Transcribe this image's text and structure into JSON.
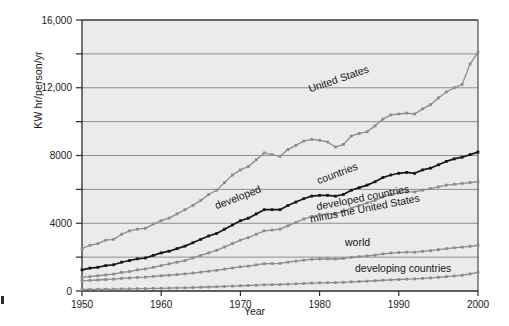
{
  "chart_data": {
    "type": "line",
    "title": "",
    "xlabel": "Year",
    "ylabel": "KW hr/person/yr",
    "xlim": [
      1950,
      2000
    ],
    "ylim": [
      0,
      16000
    ],
    "xticks": [
      1950,
      1960,
      1970,
      1980,
      1990,
      2000
    ],
    "xticklabels": [
      "1950",
      "1960",
      "1970",
      "1980",
      "1990",
      "2000"
    ],
    "yticks": [
      0,
      2000,
      4000,
      6000,
      8000,
      10000,
      12000,
      14000,
      16000
    ],
    "yticklabels": [
      "0",
      "",
      "4000",
      "",
      "8000",
      "",
      "12,000",
      "",
      "16,000"
    ],
    "grid": true,
    "grid_axis": "y",
    "legend": "inline-annotations",
    "plot_background": "#ebebeb",
    "x": [
      1950,
      1951,
      1952,
      1953,
      1954,
      1955,
      1956,
      1957,
      1958,
      1959,
      1960,
      1961,
      1962,
      1963,
      1964,
      1965,
      1966,
      1967,
      1968,
      1969,
      1970,
      1971,
      1972,
      1973,
      1974,
      1975,
      1976,
      1977,
      1978,
      1979,
      1980,
      1981,
      1982,
      1983,
      1984,
      1985,
      1986,
      1987,
      1988,
      1989,
      1990,
      1991,
      1992,
      1993,
      1994,
      1995,
      1996,
      1997,
      1998,
      1999,
      2000
    ],
    "series": [
      {
        "name": "United States",
        "color": "#8c8c8c",
        "label_text": "United States",
        "values": [
          2500,
          2700,
          2800,
          3000,
          3050,
          3350,
          3550,
          3650,
          3700,
          3950,
          4150,
          4300,
          4550,
          4800,
          5050,
          5350,
          5700,
          5950,
          6400,
          6850,
          7150,
          7350,
          7750,
          8150,
          8050,
          7950,
          8350,
          8600,
          8850,
          8950,
          8900,
          8800,
          8500,
          8650,
          9150,
          9300,
          9400,
          9750,
          10150,
          10400,
          10450,
          10500,
          10450,
          10750,
          11000,
          11400,
          11750,
          12000,
          12200,
          13400,
          14100
        ]
      },
      {
        "name": "developed countries",
        "color": "#171717",
        "label_text": "developed countries",
        "values": [
          1250,
          1350,
          1400,
          1500,
          1550,
          1700,
          1800,
          1900,
          1950,
          2100,
          2250,
          2350,
          2500,
          2650,
          2850,
          3050,
          3250,
          3400,
          3650,
          3900,
          4150,
          4300,
          4550,
          4800,
          4800,
          4800,
          5050,
          5250,
          5450,
          5600,
          5650,
          5650,
          5600,
          5700,
          5950,
          6100,
          6250,
          6450,
          6700,
          6850,
          6950,
          7000,
          6950,
          7150,
          7250,
          7450,
          7650,
          7800,
          7900,
          8050,
          8200
        ]
      },
      {
        "name": "developed countries minus the United States",
        "color": "#8c8c8c",
        "label_text": "developed countries minus the United States",
        "values": [
          800,
          850,
          900,
          950,
          1000,
          1100,
          1150,
          1250,
          1300,
          1400,
          1500,
          1600,
          1700,
          1800,
          1950,
          2100,
          2250,
          2400,
          2600,
          2800,
          3000,
          3150,
          3350,
          3550,
          3600,
          3650,
          3850,
          4050,
          4250,
          4400,
          4500,
          4550,
          4550,
          4700,
          4900,
          5050,
          5200,
          5350,
          5550,
          5700,
          5800,
          5850,
          5850,
          5950,
          6050,
          6150,
          6250,
          6300,
          6350,
          6400,
          6450
        ]
      },
      {
        "name": "world",
        "color": "#8c8c8c",
        "label_text": "world",
        "values": [
          600,
          630,
          650,
          680,
          700,
          740,
          770,
          800,
          820,
          860,
          900,
          930,
          970,
          1010,
          1060,
          1110,
          1170,
          1220,
          1290,
          1360,
          1430,
          1470,
          1540,
          1610,
          1620,
          1630,
          1700,
          1760,
          1820,
          1870,
          1890,
          1900,
          1890,
          1920,
          1990,
          2030,
          2070,
          2120,
          2190,
          2240,
          2270,
          2290,
          2290,
          2340,
          2380,
          2440,
          2500,
          2550,
          2590,
          2640,
          2700
        ]
      },
      {
        "name": "developing countries",
        "color": "#8c8c8c",
        "label_text": "developing countries",
        "values": [
          90,
          95,
          100,
          105,
          110,
          120,
          125,
          135,
          140,
          150,
          160,
          170,
          180,
          190,
          205,
          220,
          235,
          250,
          270,
          290,
          310,
          325,
          345,
          365,
          375,
          385,
          405,
          425,
          445,
          465,
          480,
          490,
          495,
          515,
          540,
          560,
          580,
          605,
          635,
          660,
          680,
          700,
          715,
          745,
          775,
          810,
          850,
          890,
          930,
          1010,
          1100
        ]
      }
    ]
  },
  "annotations": {
    "united_states": "United States",
    "developed": "developed",
    "countries": "countries",
    "developed_minus_us_line1": "developed countries",
    "developed_minus_us_line2": "minus the United States",
    "world": "world",
    "developing_countries": "developing countries"
  }
}
